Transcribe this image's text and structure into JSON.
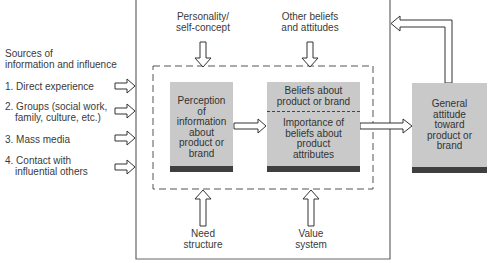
{
  "diagram": {
    "sources": {
      "heading": [
        "Sources of",
        "information and influence"
      ],
      "items": [
        {
          "lines": [
            "1. Direct experience"
          ]
        },
        {
          "lines": [
            "2. Groups (social work,",
            "family, culture, etc.)"
          ]
        },
        {
          "lines": [
            "3. Mass media"
          ]
        },
        {
          "lines": [
            "4. Contact with",
            "influential others"
          ]
        }
      ]
    },
    "top_influences": [
      {
        "lines": [
          "Personality/",
          "self-concept"
        ]
      },
      {
        "lines": [
          "Other beliefs",
          "and attitudes"
        ]
      }
    ],
    "bottom_influences": [
      {
        "lines": [
          "Need",
          "structure"
        ]
      },
      {
        "lines": [
          "Value",
          "system"
        ]
      }
    ],
    "boxes": {
      "perception": {
        "lines": [
          "Perception",
          "of",
          "information",
          "about",
          "product or",
          "brand"
        ]
      },
      "beliefs": {
        "lines": [
          "Beliefs about",
          "product or brand"
        ]
      },
      "importance": {
        "lines": [
          "Importance of",
          "beliefs about",
          "product",
          "attributes"
        ]
      },
      "attitude": {
        "lines": [
          "General",
          "attitude",
          "toward",
          "product or",
          "brand"
        ]
      }
    },
    "colors": {
      "box_fill": "#c9c9c9",
      "box_bar": "#3f3f3f",
      "line": "#555555"
    }
  }
}
